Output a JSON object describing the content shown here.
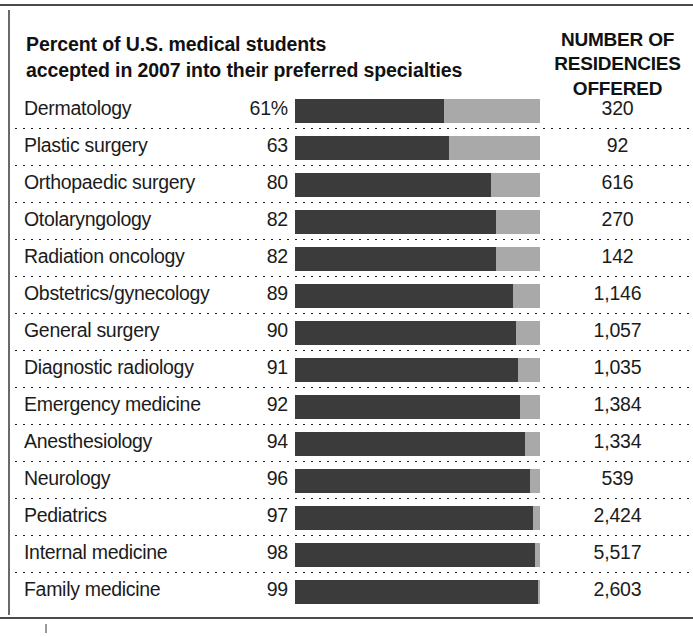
{
  "header": {
    "title_line1": "Percent of U.S. medical students",
    "title_line2": "accepted in 2007 into their preferred specialties",
    "column_header_line1": "NUMBER OF",
    "column_header_line2": "RESIDENCIES",
    "column_header_line3": "OFFERED"
  },
  "colors": {
    "bar_filled": "#3b3b3b",
    "bar_remainder": "#a9a9a9",
    "text": "#1b1b1b",
    "rule": "#4a4a4a",
    "background": "#ffffff"
  },
  "chart_data": {
    "type": "bar",
    "title": "Percent of U.S. medical students accepted in 2007 into their preferred specialties",
    "subtitle": "",
    "xlabel": "",
    "ylabel": "",
    "xlim": [
      0,
      100
    ],
    "grid": false,
    "legend": [],
    "orientation": "horizontal",
    "categories": [
      "Dermatology",
      "Plastic surgery",
      "Orthopaedic surgery",
      "Otolaryngology",
      "Radiation oncology",
      "Obstetrics/gynecology",
      "General surgery",
      "Diagnostic radiology",
      "Emergency medicine",
      "Anesthesiology",
      "Neurology",
      "Pediatrics",
      "Internal medicine",
      "Family medicine"
    ],
    "values": [
      61,
      63,
      80,
      82,
      82,
      89,
      90,
      91,
      92,
      94,
      96,
      97,
      98,
      99
    ],
    "value_labels": [
      "61%",
      "63",
      "80",
      "82",
      "82",
      "89",
      "90",
      "91",
      "92",
      "94",
      "96",
      "97",
      "98",
      "99"
    ],
    "secondary_column": {
      "label": "NUMBER OF RESIDENCIES OFFERED",
      "values": [
        320,
        92,
        616,
        270,
        142,
        1146,
        1057,
        1035,
        1384,
        1334,
        539,
        2424,
        5517,
        2603
      ],
      "value_labels": [
        "320",
        "92",
        "616",
        "270",
        "142",
        "1,146",
        "1,057",
        "1,035",
        "1,384",
        "1,334",
        "539",
        "2,424",
        "5,517",
        "2,603"
      ]
    }
  },
  "rows": [
    {
      "label": "Dermatology",
      "pct": "61%",
      "pct_value": 61,
      "count": "320"
    },
    {
      "label": "Plastic surgery",
      "pct": "63",
      "pct_value": 63,
      "count": "92"
    },
    {
      "label": "Orthopaedic surgery",
      "pct": "80",
      "pct_value": 80,
      "count": "616"
    },
    {
      "label": "Otolaryngology",
      "pct": "82",
      "pct_value": 82,
      "count": "270"
    },
    {
      "label": "Radiation oncology",
      "pct": "82",
      "pct_value": 82,
      "count": "142"
    },
    {
      "label": "Obstetrics/gynecology",
      "pct": "89",
      "pct_value": 89,
      "count": "1,146"
    },
    {
      "label": "General surgery",
      "pct": "90",
      "pct_value": 90,
      "count": "1,057"
    },
    {
      "label": "Diagnostic radiology",
      "pct": "91",
      "pct_value": 91,
      "count": "1,035"
    },
    {
      "label": "Emergency medicine",
      "pct": "92",
      "pct_value": 92,
      "count": "1,384"
    },
    {
      "label": "Anesthesiology",
      "pct": "94",
      "pct_value": 94,
      "count": "1,334"
    },
    {
      "label": "Neurology",
      "pct": "96",
      "pct_value": 96,
      "count": "539"
    },
    {
      "label": "Pediatrics",
      "pct": "97",
      "pct_value": 97,
      "count": "2,424"
    },
    {
      "label": "Internal medicine",
      "pct": "98",
      "pct_value": 98,
      "count": "5,517"
    },
    {
      "label": "Family medicine",
      "pct": "99",
      "pct_value": 99,
      "count": "2,603"
    }
  ]
}
